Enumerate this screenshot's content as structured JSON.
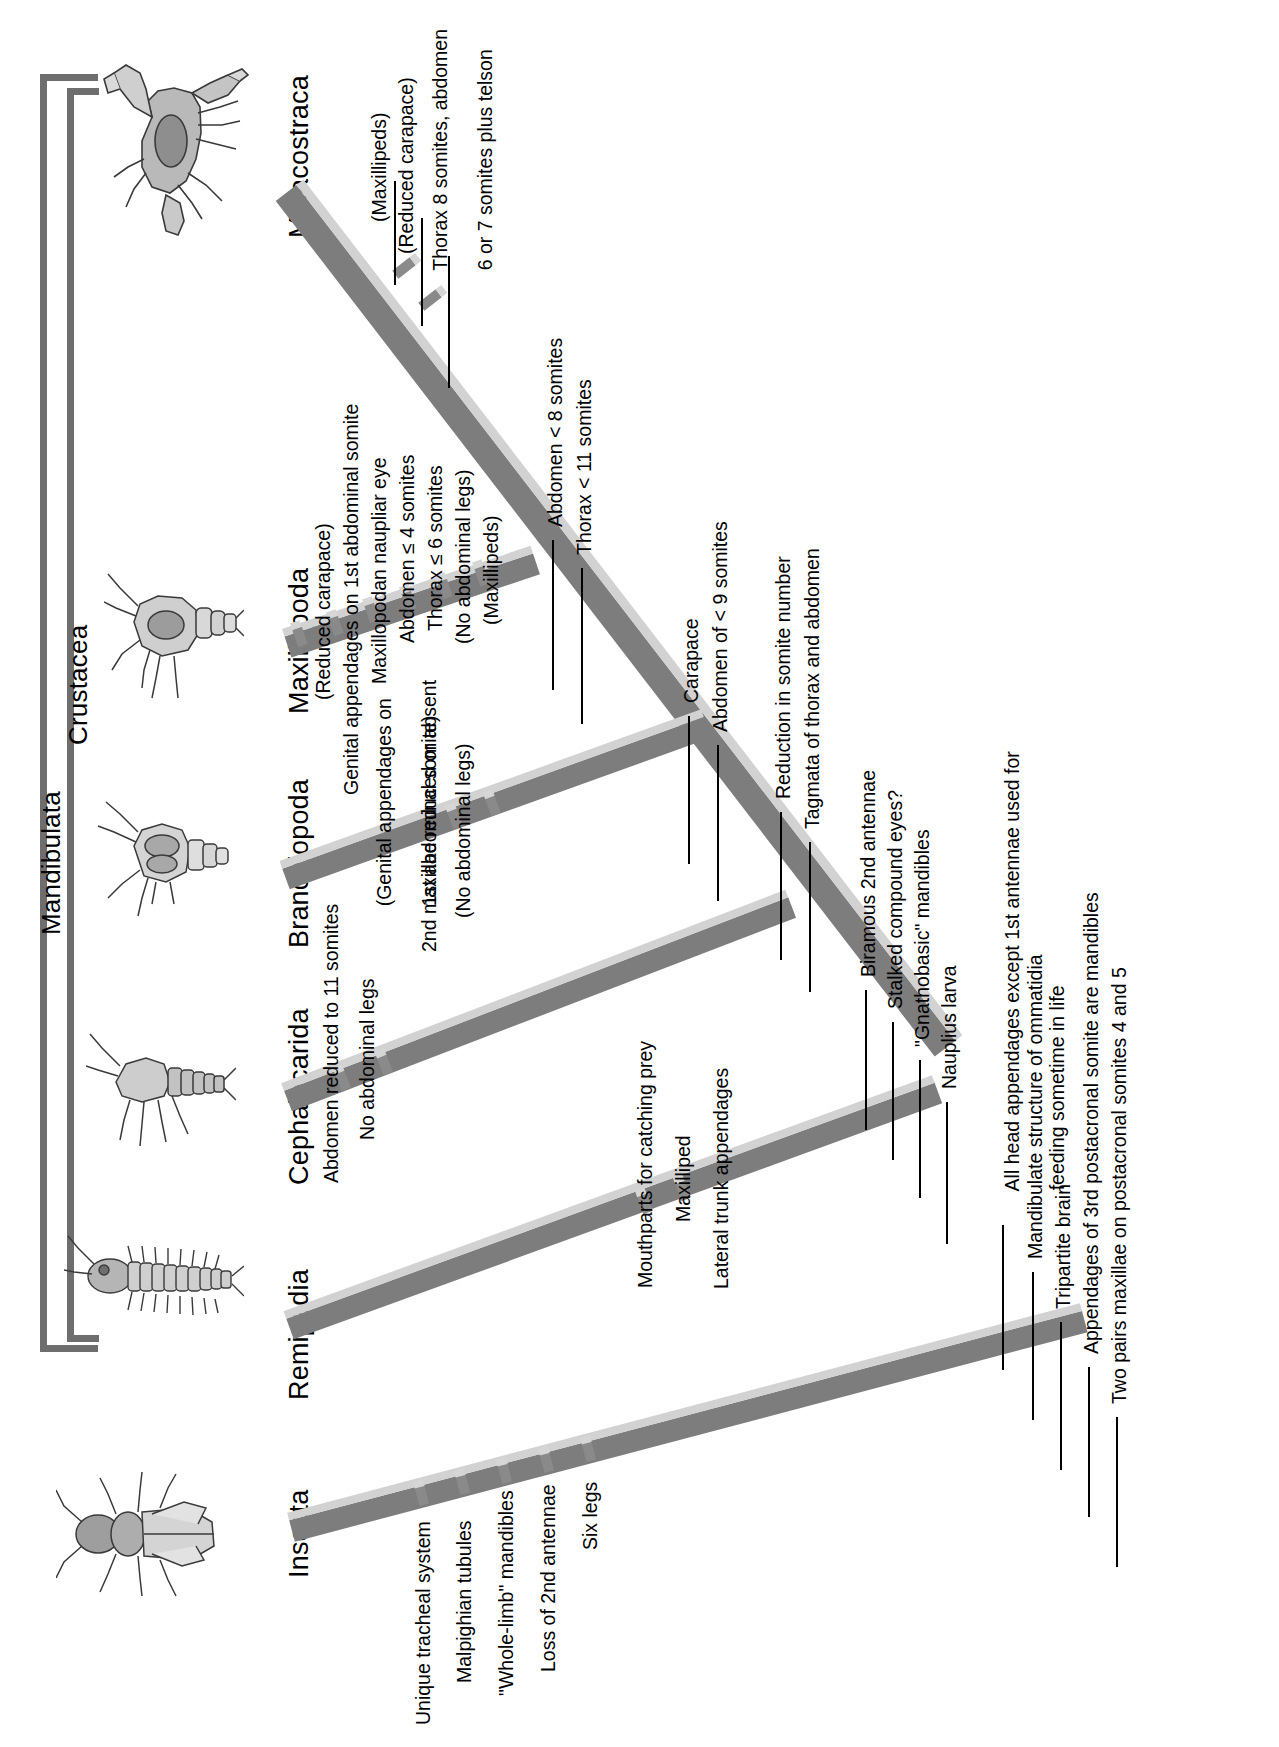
{
  "figure": {
    "type": "cladogram",
    "orientation": "rotated-90-counterclockwise"
  },
  "brackets": [
    {
      "name": "mandibulata",
      "label": "Mandibulata"
    },
    {
      "name": "crustacea",
      "label": "Crustacea"
    }
  ],
  "taxa": [
    {
      "name": "insecta",
      "label": "Insecta",
      "icon": "beetle-illustration"
    },
    {
      "name": "remipedia",
      "label": "Remipedia",
      "icon": "remipede-illustration"
    },
    {
      "name": "cephalocarida",
      "label": "Cephalocarida",
      "icon": "cephalocarid-illustration"
    },
    {
      "name": "branchiopoda",
      "label": "Branchiopoda",
      "icon": "branchiopod-illustration"
    },
    {
      "name": "maxillopoda",
      "label": "Maxillopoda",
      "icon": "copepod-illustration"
    },
    {
      "name": "malacostraca",
      "label": "Malacostraca",
      "icon": "crab-illustration"
    }
  ],
  "characters": {
    "insecta": [
      "Unique tracheal system",
      "Malpighian tubules",
      "\"Whole-limb\" mandibles",
      "Loss of 2nd antennae",
      "Six legs"
    ],
    "remipedia": [
      "Mouthparts for catching prey",
      "Maxilliped",
      "Lateral trunk appendages"
    ],
    "cephalocarida": [
      "Abdomen reduced to 11 somites",
      "No abdominal legs"
    ],
    "branchiopoda": [
      "(Genital appendages on",
      "1st abdominal somite)",
      "2nd maxillae reduced or absent",
      "(No abdominal legs)"
    ],
    "maxillopoda": [
      "(Reduced carapace)",
      "Genital appendages on 1st abdominal somite",
      "Maxillopodan naupliar eye",
      "Abdomen ≤ 4 somites",
      "Thorax ≤ 6 somites",
      "(No abdominal legs)",
      "(Maxillipeds)"
    ],
    "malacostraca": [
      "(Maxillipeds)",
      "(Reduced carapace)",
      "Thorax 8 somites, abdomen",
      "6 or 7 somites plus telson"
    ],
    "node_malacostraca_maxillopoda": [
      "Abdomen < 8 somites",
      "Thorax < 11 somites"
    ],
    "node_carapace": [
      "Carapace",
      "Abdomen of < 9 somites"
    ],
    "node_reduction": [
      "Reduction in somite number",
      "Tagmata of thorax and abdomen"
    ],
    "node_crustacea": [
      "Biramous 2nd antennae",
      "Stalked compound eyes?",
      "\"Gnathobasic\" mandibles",
      "Nauplius larva"
    ],
    "node_mandibulata": [
      "All head appendages except 1st antennae used for",
      "feeding sometime in life",
      "Mandibulate structure of ommatidia",
      "Tripartite brain",
      "Appendages of 3rd postacronal somite are mandibles",
      "Two pairs maxillae on postacronal somites 4 and 5"
    ]
  },
  "colors": {
    "ribbon_dark": "#7d7d7d",
    "ribbon_light": "#d2d2d2",
    "bracket": "#6e6e6e",
    "text": "#000000",
    "background": "#ffffff"
  }
}
